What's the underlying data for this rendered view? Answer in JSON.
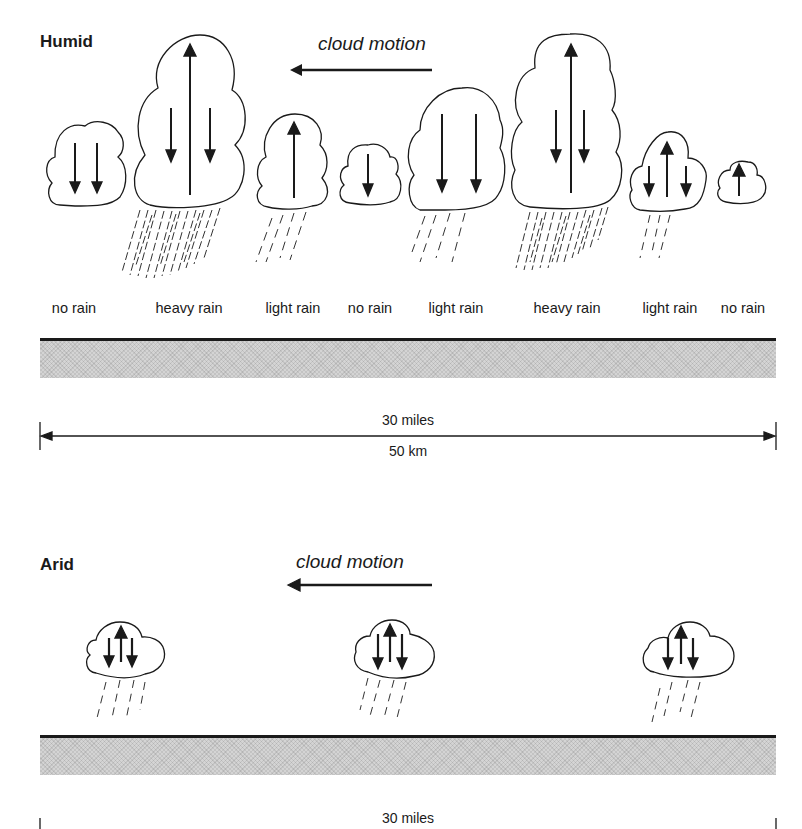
{
  "humid": {
    "title": "Humid",
    "motion_label": "cloud motion",
    "rain_labels": [
      {
        "text": "no rain",
        "x": 74
      },
      {
        "text": "heavy rain",
        "x": 189
      },
      {
        "text": "light rain",
        "x": 293
      },
      {
        "text": "no rain",
        "x": 370
      },
      {
        "text": "light rain",
        "x": 456
      },
      {
        "text": "heavy rain",
        "x": 567
      },
      {
        "text": "light rain",
        "x": 670
      },
      {
        "text": "no rain",
        "x": 743
      }
    ],
    "scale": {
      "miles": "30 miles",
      "km": "50 km"
    }
  },
  "arid": {
    "title": "Arid",
    "motion_label": "cloud motion",
    "scale": {
      "miles": "30 miles"
    }
  },
  "colors": {
    "ink": "#1a1a1a",
    "ground": "#d4d4d4",
    "background": "#ffffff"
  }
}
